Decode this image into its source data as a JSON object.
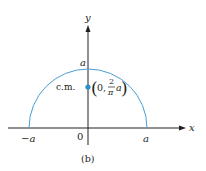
{
  "figure": {
    "caption": "(b)",
    "axes": {
      "x_label": "x",
      "y_label": "y",
      "origin_label": "0",
      "x_ticks": [
        "−a",
        "a"
      ],
      "y_tick": "a"
    },
    "curve": {
      "type": "semicircle",
      "radius_label": "a",
      "color": "#4a9fd4"
    },
    "center_of_mass": {
      "label": "c.m.",
      "coord_open": "0,",
      "frac_num": "2",
      "frac_den": "π",
      "frac_suffix": "a",
      "color": "#2b8fc8"
    },
    "colors": {
      "axis": "#231f20",
      "curve": "#4a9fd4",
      "point": "#2b8fc8"
    }
  }
}
